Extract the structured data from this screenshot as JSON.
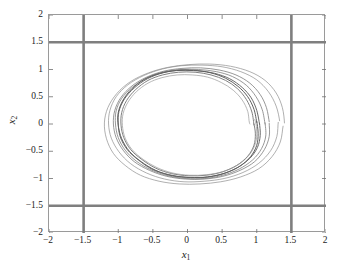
{
  "figure": {
    "name": "phase-portrait",
    "background": "#ffffff"
  },
  "axes": {
    "xlabel": "x",
    "xlabel_sub": "1",
    "ylabel": "x",
    "ylabel_sub": "2",
    "frame_color": "#9a9a9a",
    "tick_color": "#6e6e6e"
  },
  "chart_data": {
    "type": "line",
    "title": "",
    "xlabel": "x_1",
    "ylabel": "x_2",
    "xlim": [
      -2,
      2
    ],
    "ylim": [
      -2,
      2
    ],
    "xticks": [
      -2,
      -1.5,
      -1,
      -0.5,
      0,
      0.5,
      1,
      1.5,
      2
    ],
    "xticklabels": [
      "-2",
      "-1.5",
      "-1",
      "-0.5",
      "0",
      "0.5",
      "1",
      "1.5",
      "2"
    ],
    "yticks": [
      -2,
      -1.5,
      -1,
      -0.5,
      0,
      0.5,
      1,
      1.5,
      2
    ],
    "yticklabels": [
      "-2",
      "-1.5",
      "-1",
      "-0.5",
      "0",
      "0.5",
      "1",
      "1.5",
      "2"
    ],
    "grid": false,
    "legend": null,
    "annotations": [],
    "constraint_lines": {
      "color": "#7f7f7f",
      "width_px": 2.6,
      "vertical_x": [
        -1.5,
        1.5
      ],
      "horizontal_y": [
        -1.5,
        1.5
      ]
    },
    "series": [
      {
        "name": "trajectory-outer-1",
        "color": "#8e8e8e",
        "width_px": 0.7,
        "points": [
          [
            1.4,
            0.02
          ],
          [
            1.37,
            0.3
          ],
          [
            1.28,
            0.57
          ],
          [
            1.12,
            0.8
          ],
          [
            0.9,
            0.96
          ],
          [
            0.62,
            1.06
          ],
          [
            0.32,
            1.1
          ],
          [
            0.02,
            1.09
          ],
          [
            -0.28,
            1.04
          ],
          [
            -0.56,
            0.94
          ],
          [
            -0.82,
            0.78
          ],
          [
            -1.02,
            0.56
          ],
          [
            -1.15,
            0.3
          ],
          [
            -1.2,
            0.02
          ],
          [
            -1.17,
            -0.27
          ],
          [
            -1.07,
            -0.54
          ],
          [
            -0.9,
            -0.76
          ],
          [
            -0.68,
            -0.94
          ],
          [
            -0.41,
            -1.05
          ],
          [
            -0.12,
            -1.1
          ],
          [
            0.18,
            -1.1
          ],
          [
            0.48,
            -1.06
          ],
          [
            0.77,
            -0.97
          ],
          [
            1.03,
            -0.82
          ],
          [
            1.22,
            -0.6
          ],
          [
            1.34,
            -0.33
          ],
          [
            1.38,
            -0.04
          ]
        ]
      },
      {
        "name": "trajectory-outer-2",
        "color": "#8e8e8e",
        "width_px": 0.7,
        "points": [
          [
            1.33,
            0.06
          ],
          [
            1.28,
            0.33
          ],
          [
            1.17,
            0.59
          ],
          [
            1.0,
            0.81
          ],
          [
            0.77,
            0.96
          ],
          [
            0.5,
            1.05
          ],
          [
            0.21,
            1.08
          ],
          [
            -0.08,
            1.07
          ],
          [
            -0.36,
            1.01
          ],
          [
            -0.63,
            0.89
          ],
          [
            -0.86,
            0.72
          ],
          [
            -1.03,
            0.5
          ],
          [
            -1.12,
            0.25
          ],
          [
            -1.14,
            0.0
          ],
          [
            -1.1,
            -0.26
          ],
          [
            -0.99,
            -0.51
          ],
          [
            -0.82,
            -0.73
          ],
          [
            -0.59,
            -0.9
          ],
          [
            -0.33,
            -1.01
          ],
          [
            -0.05,
            -1.06
          ],
          [
            0.24,
            -1.05
          ],
          [
            0.53,
            -1.0
          ],
          [
            0.8,
            -0.89
          ],
          [
            1.03,
            -0.72
          ],
          [
            1.2,
            -0.49
          ],
          [
            1.29,
            -0.23
          ],
          [
            1.31,
            0.03
          ]
        ]
      },
      {
        "name": "trajectory-mid-1",
        "color": "#7d7d7d",
        "width_px": 0.8,
        "points": [
          [
            1.18,
            0.04
          ],
          [
            1.14,
            0.3
          ],
          [
            1.05,
            0.54
          ],
          [
            0.9,
            0.75
          ],
          [
            0.7,
            0.9
          ],
          [
            0.46,
            0.99
          ],
          [
            0.19,
            1.03
          ],
          [
            -0.08,
            1.02
          ],
          [
            -0.34,
            0.97
          ],
          [
            -0.59,
            0.86
          ],
          [
            -0.8,
            0.7
          ],
          [
            -0.96,
            0.49
          ],
          [
            -1.05,
            0.25
          ],
          [
            -1.07,
            0.0
          ],
          [
            -1.03,
            -0.25
          ],
          [
            -0.93,
            -0.48
          ],
          [
            -0.77,
            -0.69
          ],
          [
            -0.55,
            -0.85
          ],
          [
            -0.3,
            -0.96
          ],
          [
            -0.03,
            -1.01
          ],
          [
            0.24,
            -1.01
          ],
          [
            0.51,
            -0.96
          ],
          [
            0.76,
            -0.85
          ],
          [
            0.97,
            -0.69
          ],
          [
            1.11,
            -0.47
          ],
          [
            1.18,
            -0.23
          ],
          [
            1.18,
            0.01
          ]
        ]
      },
      {
        "name": "trajectory-mid-2",
        "color": "#7d7d7d",
        "width_px": 0.8,
        "points": [
          [
            1.12,
            0.0
          ],
          [
            1.08,
            0.26
          ],
          [
            0.99,
            0.5
          ],
          [
            0.85,
            0.71
          ],
          [
            0.65,
            0.87
          ],
          [
            0.42,
            0.96
          ],
          [
            0.16,
            1.0
          ],
          [
            -0.11,
            1.0
          ],
          [
            -0.36,
            0.95
          ],
          [
            -0.6,
            0.84
          ],
          [
            -0.8,
            0.67
          ],
          [
            -0.95,
            0.47
          ],
          [
            -1.03,
            0.24
          ],
          [
            -1.04,
            0.0
          ],
          [
            -1.0,
            -0.25
          ],
          [
            -0.9,
            -0.48
          ],
          [
            -0.74,
            -0.68
          ],
          [
            -0.53,
            -0.84
          ],
          [
            -0.28,
            -0.95
          ],
          [
            -0.02,
            -1.0
          ],
          [
            0.25,
            -1.0
          ],
          [
            0.51,
            -0.94
          ],
          [
            0.74,
            -0.83
          ],
          [
            0.94,
            -0.66
          ],
          [
            1.07,
            -0.45
          ],
          [
            1.13,
            -0.22
          ],
          [
            1.12,
            0.02
          ]
        ]
      },
      {
        "name": "limit-cycle-1",
        "color": "#6a6a6a",
        "width_px": 1.0,
        "points": [
          [
            1.04,
            0.0
          ],
          [
            1.0,
            0.25
          ],
          [
            0.92,
            0.48
          ],
          [
            0.79,
            0.67
          ],
          [
            0.61,
            0.83
          ],
          [
            0.39,
            0.93
          ],
          [
            0.15,
            0.98
          ],
          [
            -0.1,
            0.99
          ],
          [
            -0.35,
            0.94
          ],
          [
            -0.58,
            0.83
          ],
          [
            -0.77,
            0.66
          ],
          [
            -0.91,
            0.46
          ],
          [
            -0.99,
            0.23
          ],
          [
            -1.0,
            0.0
          ],
          [
            -0.97,
            -0.24
          ],
          [
            -0.87,
            -0.47
          ],
          [
            -0.71,
            -0.66
          ],
          [
            -0.51,
            -0.83
          ],
          [
            -0.27,
            -0.93
          ],
          [
            -0.01,
            -0.98
          ],
          [
            0.25,
            -0.98
          ],
          [
            0.5,
            -0.92
          ],
          [
            0.72,
            -0.8
          ],
          [
            0.9,
            -0.63
          ],
          [
            1.01,
            -0.43
          ],
          [
            1.05,
            -0.21
          ],
          [
            1.04,
            0.01
          ]
        ]
      },
      {
        "name": "limit-cycle-2",
        "color": "#5f5f5f",
        "width_px": 1.0,
        "points": [
          [
            1.0,
            0.03
          ],
          [
            0.96,
            0.27
          ],
          [
            0.87,
            0.5
          ],
          [
            0.73,
            0.69
          ],
          [
            0.55,
            0.84
          ],
          [
            0.33,
            0.94
          ],
          [
            0.09,
            0.98
          ],
          [
            -0.16,
            0.98
          ],
          [
            -0.4,
            0.93
          ],
          [
            -0.62,
            0.82
          ],
          [
            -0.8,
            0.65
          ],
          [
            -0.93,
            0.44
          ],
          [
            -1.0,
            0.21
          ],
          [
            -1.0,
            -0.03
          ],
          [
            -0.95,
            -0.27
          ],
          [
            -0.84,
            -0.5
          ],
          [
            -0.67,
            -0.69
          ],
          [
            -0.46,
            -0.85
          ],
          [
            -0.22,
            -0.95
          ],
          [
            0.04,
            -0.98
          ],
          [
            0.29,
            -0.97
          ],
          [
            0.54,
            -0.9
          ],
          [
            0.75,
            -0.78
          ],
          [
            0.91,
            -0.6
          ],
          [
            1.0,
            -0.39
          ],
          [
            1.02,
            -0.17
          ],
          [
            1.0,
            0.05
          ]
        ]
      },
      {
        "name": "limit-cycle-3",
        "color": "#727272",
        "width_px": 0.9,
        "points": [
          [
            0.96,
            -0.02
          ],
          [
            0.93,
            0.22
          ],
          [
            0.85,
            0.45
          ],
          [
            0.72,
            0.65
          ],
          [
            0.55,
            0.8
          ],
          [
            0.34,
            0.9
          ],
          [
            0.11,
            0.95
          ],
          [
            -0.13,
            0.95
          ],
          [
            -0.36,
            0.9
          ],
          [
            -0.57,
            0.8
          ],
          [
            -0.75,
            0.63
          ],
          [
            -0.88,
            0.43
          ],
          [
            -0.95,
            0.21
          ],
          [
            -0.96,
            -0.02
          ],
          [
            -0.92,
            -0.25
          ],
          [
            -0.82,
            -0.47
          ],
          [
            -0.66,
            -0.65
          ],
          [
            -0.46,
            -0.81
          ],
          [
            -0.23,
            -0.91
          ],
          [
            0.02,
            -0.95
          ],
          [
            0.27,
            -0.94
          ],
          [
            0.5,
            -0.88
          ],
          [
            0.71,
            -0.76
          ],
          [
            0.87,
            -0.59
          ],
          [
            0.96,
            -0.39
          ],
          [
            0.98,
            -0.18
          ],
          [
            0.96,
            0.0
          ]
        ]
      },
      {
        "name": "trajectory-inner-spiral",
        "color": "#9a9a9a",
        "width_px": 0.7,
        "points": [
          [
            0.9,
            0.0
          ],
          [
            0.87,
            0.23
          ],
          [
            0.79,
            0.44
          ],
          [
            0.66,
            0.62
          ],
          [
            0.49,
            0.76
          ],
          [
            0.29,
            0.86
          ],
          [
            0.07,
            0.9
          ],
          [
            -0.15,
            0.9
          ],
          [
            -0.37,
            0.85
          ],
          [
            -0.57,
            0.75
          ],
          [
            -0.74,
            0.59
          ],
          [
            -0.86,
            0.4
          ],
          [
            -0.93,
            0.19
          ],
          [
            -0.94,
            -0.03
          ],
          [
            -0.9,
            -0.26
          ],
          [
            -0.8,
            -0.47
          ],
          [
            -0.64,
            -0.65
          ],
          [
            -0.44,
            -0.8
          ],
          [
            -0.21,
            -0.9
          ],
          [
            0.03,
            -0.94
          ],
          [
            0.28,
            -0.93
          ],
          [
            0.52,
            -0.87
          ],
          [
            0.73,
            -0.75
          ],
          [
            0.89,
            -0.57
          ],
          [
            0.98,
            -0.36
          ],
          [
            1.0,
            -0.14
          ],
          [
            0.97,
            0.08
          ]
        ]
      }
    ]
  }
}
